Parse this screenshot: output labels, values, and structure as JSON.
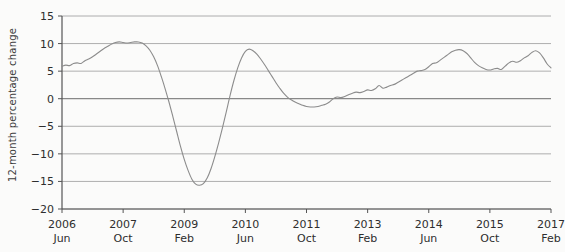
{
  "chart_data": {
    "type": "line",
    "title": "",
    "subtitle": "",
    "xlabel": "",
    "ylabel": "12-month percentage change",
    "ylim": [
      -20,
      15
    ],
    "yticks": [
      15,
      10,
      5,
      0,
      -5,
      -10,
      -15,
      -20
    ],
    "ytick_labels": [
      "15",
      "10",
      "5",
      "0",
      "−5",
      "−10",
      "−15",
      "−20"
    ],
    "grid": true,
    "grid_axis": "y",
    "legend": "none",
    "line_color": "#8c8c8c",
    "zero_line_color": "#6b6b6b",
    "axis_color": "#555555",
    "background_color": "#fbfbfa",
    "xtick_labels": [
      {
        "year": "2006",
        "month": "Jun"
      },
      {
        "year": "2007",
        "month": "Oct"
      },
      {
        "year": "2009",
        "month": "Feb"
      },
      {
        "year": "2010",
        "month": "Jun"
      },
      {
        "year": "2011",
        "month": "Oct"
      },
      {
        "year": "2013",
        "month": "Feb"
      },
      {
        "year": "2014",
        "month": "Jun"
      },
      {
        "year": "2015",
        "month": "Oct"
      },
      {
        "year": "2017",
        "month": "Feb"
      }
    ],
    "x_start": "2006 Jun",
    "x_end": "2017 Feb",
    "x_interval_months": 1,
    "annotations": [],
    "series": [
      {
        "name": "12-month percentage change",
        "color": "#8c8c8c",
        "x": [
          "2006-06",
          "2006-07",
          "2006-08",
          "2006-09",
          "2006-10",
          "2006-11",
          "2006-12",
          "2007-01",
          "2007-02",
          "2007-03",
          "2007-04",
          "2007-05",
          "2007-06",
          "2007-07",
          "2007-08",
          "2007-09",
          "2007-10",
          "2007-11",
          "2007-12",
          "2008-01",
          "2008-02",
          "2008-03",
          "2008-04",
          "2008-05",
          "2008-06",
          "2008-07",
          "2008-08",
          "2008-09",
          "2008-10",
          "2008-11",
          "2008-12",
          "2009-01",
          "2009-02",
          "2009-03",
          "2009-04",
          "2009-05",
          "2009-06",
          "2009-07",
          "2009-08",
          "2009-09",
          "2009-10",
          "2009-11",
          "2009-12",
          "2010-01",
          "2010-02",
          "2010-03",
          "2010-04",
          "2010-05",
          "2010-06",
          "2010-07",
          "2010-08",
          "2010-09",
          "2010-10",
          "2010-11",
          "2010-12",
          "2011-01",
          "2011-02",
          "2011-03",
          "2011-04",
          "2011-05",
          "2011-06",
          "2011-07",
          "2011-08",
          "2011-09",
          "2011-10",
          "2011-11",
          "2011-12",
          "2012-01",
          "2012-02",
          "2012-03",
          "2012-04",
          "2012-05",
          "2012-06",
          "2012-07",
          "2012-08",
          "2012-09",
          "2012-10",
          "2012-11",
          "2012-12",
          "2013-01",
          "2013-02",
          "2013-03",
          "2013-04",
          "2013-05",
          "2013-06",
          "2013-07",
          "2013-08",
          "2013-09",
          "2013-10",
          "2013-11",
          "2013-12",
          "2014-01",
          "2014-02",
          "2014-03",
          "2014-04",
          "2014-05",
          "2014-06",
          "2014-07",
          "2014-08",
          "2014-09",
          "2014-10",
          "2014-11",
          "2014-12",
          "2015-01",
          "2015-02",
          "2015-03",
          "2015-04",
          "2015-05",
          "2015-06",
          "2015-07",
          "2015-08",
          "2015-09",
          "2015-10",
          "2015-11",
          "2015-12",
          "2016-01",
          "2016-02",
          "2016-03",
          "2016-04",
          "2016-05",
          "2016-06",
          "2016-07",
          "2016-08",
          "2016-09",
          "2016-10",
          "2016-11",
          "2016-12",
          "2017-01",
          "2017-02"
        ],
        "values": [
          5.9,
          6.1,
          6.0,
          6.4,
          6.5,
          6.4,
          6.9,
          7.2,
          7.6,
          8.1,
          8.6,
          9.1,
          9.5,
          9.9,
          10.2,
          10.3,
          10.2,
          10.1,
          10.2,
          10.3,
          10.3,
          10.1,
          9.6,
          8.8,
          7.6,
          6.0,
          4.0,
          1.8,
          -0.6,
          -3.2,
          -5.9,
          -8.6,
          -11.0,
          -13.0,
          -14.6,
          -15.5,
          -15.7,
          -15.4,
          -14.4,
          -12.7,
          -10.5,
          -8.0,
          -5.3,
          -2.4,
          0.6,
          3.3,
          5.6,
          7.4,
          8.6,
          9.0,
          8.7,
          8.1,
          7.2,
          6.2,
          5.1,
          4.0,
          2.9,
          1.9,
          1.0,
          0.3,
          -0.2,
          -0.6,
          -0.9,
          -1.2,
          -1.4,
          -1.5,
          -1.5,
          -1.4,
          -1.2,
          -1.0,
          -0.6,
          0.0,
          0.3,
          0.2,
          0.4,
          0.7,
          1.0,
          1.2,
          1.1,
          1.3,
          1.6,
          1.5,
          1.8,
          2.4,
          1.9,
          2.1,
          2.4,
          2.6,
          3.0,
          3.4,
          3.8,
          4.2,
          4.6,
          5.0,
          5.1,
          5.3,
          5.8,
          6.4,
          6.5,
          7.0,
          7.5,
          8.0,
          8.5,
          8.8,
          8.9,
          8.7,
          8.2,
          7.4,
          6.6,
          6.0,
          5.6,
          5.3,
          5.2,
          5.4,
          5.5,
          5.3,
          5.9,
          6.5,
          6.8,
          6.6,
          6.9,
          7.4,
          7.8,
          8.4,
          8.7,
          8.3,
          7.4,
          6.3,
          5.6
        ]
      }
    ]
  },
  "axis": {
    "y_label": "12-month percentage change"
  }
}
